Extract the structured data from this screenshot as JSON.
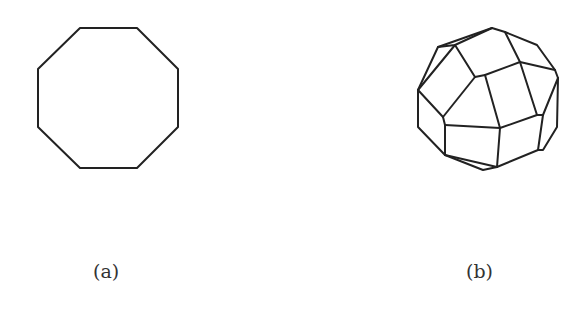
{
  "figures": [
    {
      "id": "a",
      "caption": "(a)",
      "shape": "octagon",
      "description": "Regular octagon outline"
    },
    {
      "id": "b",
      "caption": "(b)",
      "shape": "polyhedron",
      "description": "Wireframe polyhedron with pentagonal, square and triangular faces"
    }
  ],
  "colors": {
    "stroke": "#222222",
    "background": "#ffffff",
    "caption": "#333333"
  }
}
